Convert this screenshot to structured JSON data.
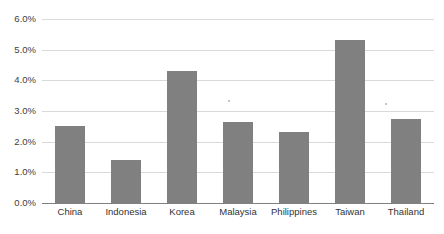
{
  "chart_data": {
    "type": "bar",
    "title": "",
    "subtitle": "",
    "xlabel": "",
    "ylabel": "",
    "categories": [
      "China",
      "Indonesia",
      "Korea",
      "Malaysia",
      "Philippines",
      "Taiwan",
      "Thailand"
    ],
    "values": [
      2.5,
      1.4,
      4.3,
      2.65,
      2.3,
      5.3,
      2.75
    ],
    "value_format": "percent",
    "ylim": [
      0.0,
      6.0
    ],
    "ytick_values": [
      0.0,
      1.0,
      2.0,
      3.0,
      4.0,
      5.0,
      6.0
    ],
    "ytick_labels": [
      "0.0%",
      "1.0%",
      "2.0%",
      "3.0%",
      "4.0%",
      "5.0%",
      "6.0%"
    ],
    "grid": true,
    "legend": false,
    "legend_position": "none",
    "series": [
      {
        "name": "",
        "values": [
          2.5,
          1.4,
          4.3,
          2.65,
          2.3,
          5.3,
          2.75
        ]
      }
    ]
  },
  "style": {
    "bar_color": "#808080",
    "gridline_color": "#d9d9d9",
    "axis_color": "#808080",
    "background_color": "#ffffff",
    "label_color": "#333333",
    "tick_label_color": "#404040"
  }
}
